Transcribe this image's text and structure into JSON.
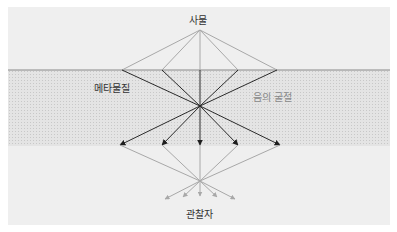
{
  "labels": {
    "object": "사물",
    "metamaterial": "메타물질",
    "negative_refraction": "음의 굴절",
    "observer": "관찰자"
  },
  "colors": {
    "panel_bg": "#efefef",
    "band_bg": "#e4e4e4",
    "surface_line": "#8a8a8a",
    "incident_rays": "#a8a8a8",
    "refracted_rays": "#2a2a2a",
    "exit_rays": "#a8a8a8",
    "label_dark": "#333333",
    "label_light": "#888888"
  },
  "geometry": {
    "source": [
      200,
      30
    ],
    "surface_y": 70,
    "surface_hits_x": [
      122,
      162,
      200,
      238,
      277
    ],
    "internal_focus": [
      200,
      106
    ],
    "arrow_tips": [
      [
        120,
        145
      ],
      [
        162,
        145
      ],
      [
        200,
        145
      ],
      [
        238,
        145
      ],
      [
        280,
        145
      ]
    ],
    "external_focus": [
      200,
      181
    ],
    "small_arrow_tips": [
      [
        165,
        199
      ],
      [
        183,
        197
      ],
      [
        200,
        196
      ],
      [
        217,
        197
      ],
      [
        235,
        199
      ]
    ]
  }
}
